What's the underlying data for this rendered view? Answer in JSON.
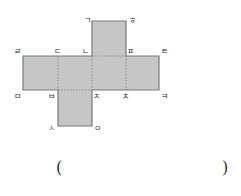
{
  "diagram": {
    "type": "cube-net",
    "colors": {
      "fill": "#c6c6c6",
      "stroke": "#7a7a7a",
      "fold": "#8a8a8a",
      "text": "#333333"
    },
    "faces": [
      {
        "name": "top-face",
        "x": 92,
        "y": 21,
        "w": 34,
        "h": 35
      },
      {
        "name": "row-face-1",
        "x": 23,
        "y": 56,
        "w": 35,
        "h": 34
      },
      {
        "name": "row-face-2",
        "x": 58,
        "y": 56,
        "w": 34,
        "h": 34
      },
      {
        "name": "row-face-3",
        "x": 92,
        "y": 56,
        "w": 34,
        "h": 34
      },
      {
        "name": "row-face-4",
        "x": 126,
        "y": 56,
        "w": 33,
        "h": 34
      },
      {
        "name": "bottom-face",
        "x": 58,
        "y": 90,
        "w": 34,
        "h": 36
      }
    ],
    "vertex_labels": [
      {
        "id": "g",
        "text": "ㄱ",
        "x": 84,
        "y": 23
      },
      {
        "id": "h",
        "text": "ㅎ",
        "x": 129,
        "y": 23
      },
      {
        "id": "r",
        "text": "ㄹ",
        "x": 14,
        "y": 54
      },
      {
        "id": "d",
        "text": "ㄷ",
        "x": 54,
        "y": 54
      },
      {
        "id": "n",
        "text": "ㄴ",
        "x": 82,
        "y": 54
      },
      {
        "id": "p",
        "text": "ㅍ",
        "x": 127,
        "y": 54
      },
      {
        "id": "t",
        "text": "ㅌ",
        "x": 161,
        "y": 54
      },
      {
        "id": "m",
        "text": "ㅁ",
        "x": 14,
        "y": 99
      },
      {
        "id": "b",
        "text": "ㅂ",
        "x": 48,
        "y": 99
      },
      {
        "id": "j",
        "text": "ㅈ",
        "x": 93,
        "y": 99
      },
      {
        "id": "ch",
        "text": "ㅊ",
        "x": 122,
        "y": 99
      },
      {
        "id": "k",
        "text": "ㅋ",
        "x": 161,
        "y": 99
      },
      {
        "id": "s",
        "text": "ㅅ",
        "x": 48,
        "y": 131
      },
      {
        "id": "o",
        "text": "ㅇ",
        "x": 94,
        "y": 131
      }
    ]
  },
  "answer": {
    "open_paren": "(",
    "close_paren": ")",
    "value": ""
  }
}
